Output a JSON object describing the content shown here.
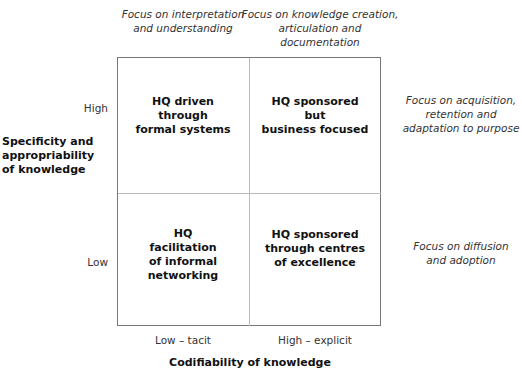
{
  "top_annotations": {
    "left": "Focus on interpretation\nand understanding",
    "right": "Focus on knowledge creation,\narticulation and documentation"
  },
  "right_annotations": {
    "top": "Focus on acquisition,\nretention and\nadaptation to purpose",
    "bottom": "Focus on diffusion\nand adoption"
  },
  "y_axis": {
    "title": "Specificity and\nappropriability\nof knowledge",
    "high": "High",
    "low": "Low"
  },
  "x_axis": {
    "title": "Codifiability of knowledge",
    "low": "Low – tacit",
    "high": "High – explicit"
  },
  "quadrants": {
    "top_left": "HQ driven\nthrough\nformal systems",
    "top_right": "HQ sponsored\nbut\nbusiness focused",
    "bottom_left": "HQ\nfacilitation\nof informal\nnetworking",
    "bottom_right": "HQ sponsored\nthrough centres\nof excellence"
  }
}
